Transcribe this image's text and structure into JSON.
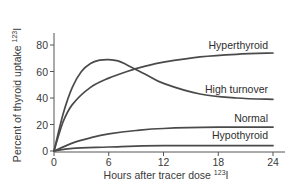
{
  "chart_data": {
    "type": "line",
    "title": "",
    "xlabel": "Hours after tracer dose",
    "xlabel_superscript": "123",
    "xlabel_suffix": "I",
    "ylabel": "Percent of thyroid uptake",
    "ylabel_superscript": "123",
    "ylabel_suffix": "I",
    "xlim": [
      0,
      24
    ],
    "ylim": [
      0,
      85
    ],
    "x_ticks": [
      0,
      6,
      12,
      18,
      24
    ],
    "y_ticks": [
      0,
      20,
      40,
      60,
      80
    ],
    "grid": false,
    "legend": "inline labels at right end of curves",
    "series": [
      {
        "name": "Hyperthyroid",
        "x": [
          0,
          1,
          2,
          4,
          6,
          8,
          10,
          12,
          16,
          20,
          24
        ],
        "values": [
          0,
          22,
          35,
          48,
          55,
          60,
          64,
          67,
          71,
          73,
          74
        ]
      },
      {
        "name": "High turnover",
        "x": [
          0,
          1,
          2,
          3,
          4,
          5,
          6,
          7,
          8,
          10,
          12,
          16,
          20,
          24
        ],
        "values": [
          0,
          28,
          48,
          60,
          66,
          68.5,
          69,
          68,
          65,
          58,
          51,
          43,
          40,
          39
        ]
      },
      {
        "name": "Normal",
        "x": [
          0,
          2,
          4,
          6,
          9,
          12,
          18,
          24
        ],
        "values": [
          0,
          6,
          10,
          13,
          15.5,
          17,
          18,
          18
        ]
      },
      {
        "name": "Hypothyroid",
        "x": [
          0,
          2,
          6,
          12,
          24
        ],
        "values": [
          0,
          2,
          3,
          4,
          4
        ]
      }
    ]
  },
  "labels": {
    "hyperthyroid": "Hyperthyroid",
    "high_turnover": "High turnover",
    "normal": "Normal",
    "hypothyroid": "Hypothyroid"
  },
  "axes": {
    "x_title": "Hours after tracer dose ",
    "x_sup": "123",
    "x_suffix": "I",
    "y_title": "Percent of thyroid uptake ",
    "y_sup": "123",
    "y_suffix": "I",
    "x_ticks": [
      "0",
      "6",
      "12",
      "18",
      "24"
    ],
    "y_ticks": [
      "0",
      "20",
      "40",
      "60",
      "80"
    ]
  }
}
